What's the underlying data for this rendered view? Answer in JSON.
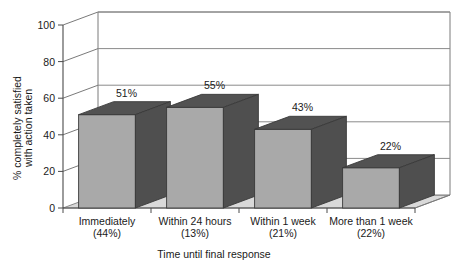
{
  "chart_data": {
    "type": "bar",
    "title": "",
    "subtitle": "",
    "xlabel": "Time until final response",
    "ylabel": "% completely satisfied with action taken",
    "ylabel_line1": "% completely satisfied",
    "ylabel_line2": "with action taken",
    "categories": [
      "Immediately",
      "Within 24 hours",
      "Within 1 week",
      "More than 1 week"
    ],
    "category_sublabels": [
      "(44%)",
      "(13%)",
      "(21%)",
      "(22%)"
    ],
    "values": [
      51,
      55,
      43,
      22
    ],
    "value_labels": [
      "51%",
      "55%",
      "43%",
      "22%"
    ],
    "ylim": [
      0,
      100
    ],
    "yticks": [
      0,
      20,
      40,
      60,
      80,
      100
    ],
    "ytick_labels": [
      "0",
      "20",
      "40",
      "60",
      "80",
      "100"
    ],
    "grid": true,
    "legend": "none",
    "style": "3d-column",
    "colors": {
      "bar_front": "#a9a9a9",
      "bar_side": "#4f4f4f",
      "bar_top": "#525252",
      "floor": "#d9d9d9",
      "wall": "#ffffff",
      "gridline": "#8a8a8a",
      "axis": "#4a4a4a",
      "text": "#1a1a1a",
      "background": "#ffffff"
    }
  }
}
